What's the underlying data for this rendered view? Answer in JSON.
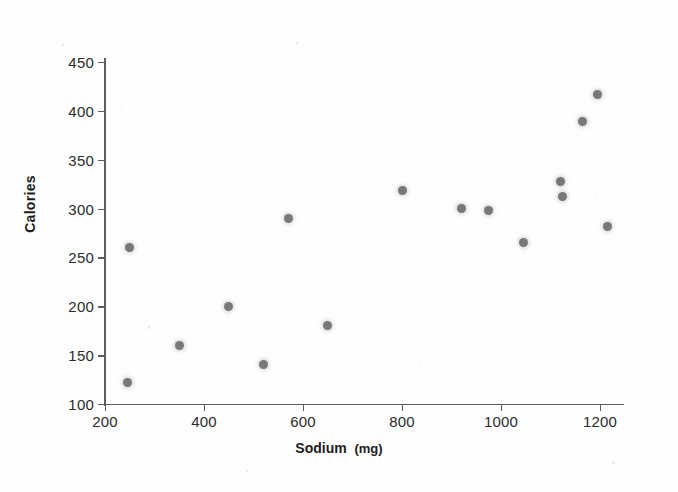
{
  "chart_data": {
    "type": "scatter",
    "title": "",
    "xlabel": "Sodium",
    "xunit": "(mg)",
    "ylabel": "Calories",
    "xlim": [
      200,
      1250
    ],
    "ylim": [
      100,
      450
    ],
    "xticks": [
      200,
      400,
      600,
      800,
      1000,
      1200
    ],
    "yticks": [
      100,
      150,
      200,
      250,
      300,
      350,
      400,
      450
    ],
    "grid": false,
    "legend": null,
    "marker_color": "#787878",
    "axis_color": "#5d5d5d",
    "background_color": "#fefefe",
    "points": [
      {
        "x": 245,
        "y": 122
      },
      {
        "x": 250,
        "y": 260
      },
      {
        "x": 350,
        "y": 160
      },
      {
        "x": 450,
        "y": 200
      },
      {
        "x": 520,
        "y": 140
      },
      {
        "x": 570,
        "y": 290
      },
      {
        "x": 650,
        "y": 180
      },
      {
        "x": 800,
        "y": 318
      },
      {
        "x": 920,
        "y": 300
      },
      {
        "x": 975,
        "y": 298
      },
      {
        "x": 1045,
        "y": 265
      },
      {
        "x": 1120,
        "y": 328
      },
      {
        "x": 1125,
        "y": 312
      },
      {
        "x": 1165,
        "y": 389
      },
      {
        "x": 1195,
        "y": 417
      },
      {
        "x": 1215,
        "y": 282
      }
    ]
  },
  "axes": {
    "x_tick_labels": [
      "200",
      "400",
      "600",
      "800",
      "1000",
      "1200"
    ],
    "y_tick_labels": [
      "100",
      "150",
      "200",
      "250",
      "300",
      "350",
      "400",
      "450"
    ],
    "x_title": "Sodium",
    "x_title_unit": "(mg)",
    "y_title": "Calories"
  }
}
